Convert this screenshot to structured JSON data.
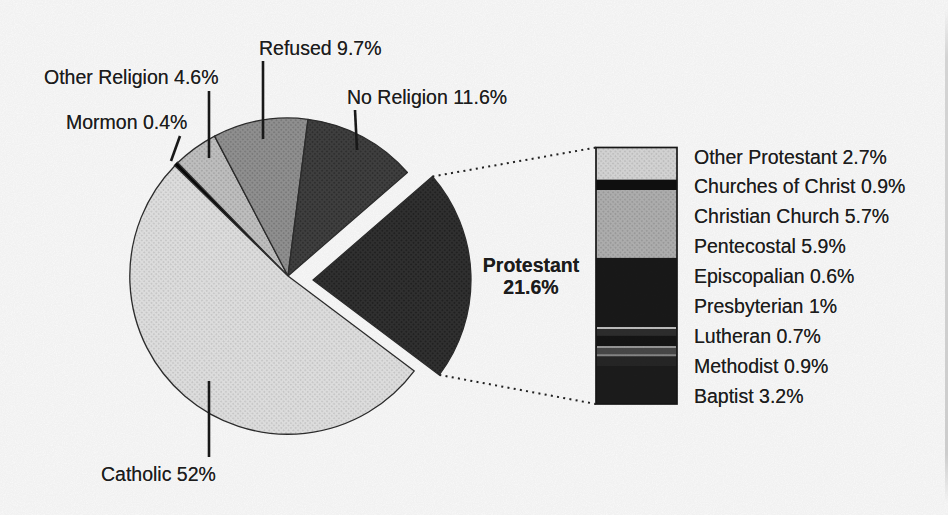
{
  "chart_data": {
    "type": "pie",
    "subtype": "bar-of-pie",
    "title": "",
    "legend_position": "none",
    "background_color": "#ffffff",
    "text_color": "#1c1c1c",
    "pie": {
      "slices": [
        {
          "label": "Mormon",
          "value": 0.4,
          "display": "Mormon 0.4%",
          "color": "#0a0a0a",
          "exploded": false
        },
        {
          "label": "Other Religion",
          "value": 4.6,
          "display": "Other Religion 4.6%",
          "color": "#c7c7c7",
          "dot_color": "#aaaaaa",
          "exploded": false
        },
        {
          "label": "Refused",
          "value": 9.7,
          "display": "Refused 9.7%",
          "color": "#969696",
          "dot_color": "#7b7b7b",
          "exploded": false
        },
        {
          "label": "No Religion",
          "value": 11.6,
          "display": "No Religion 11.6%",
          "color": "#424242",
          "dot_color": "#2d2d2d",
          "exploded": false
        },
        {
          "label": "Protestant",
          "value": 21.6,
          "display": "Protestant 21.6%",
          "display_lines": [
            "Protestant",
            "21.6%"
          ],
          "color": "#323232",
          "dot_color": "#1f1f1f",
          "exploded": true
        },
        {
          "label": "Catholic",
          "value": 52,
          "display": "Catholic 52%",
          "color": "#e7e7e7",
          "dot_color": "#cdcdcd",
          "exploded": false
        }
      ]
    },
    "breakdown": {
      "parent_label": "Protestant",
      "parent_value": 21.6,
      "segments": [
        {
          "label": "Other Protestant",
          "value": 2.7,
          "display": "Other Protestant 2.7%",
          "color": "#dcdcdc",
          "dot_color": "#c3c3c3"
        },
        {
          "label": "Churches of Christ",
          "value": 0.9,
          "display": "Churches of Christ 0.9%",
          "color": "#101010"
        },
        {
          "label": "Christian Church",
          "value": 5.7,
          "display": "Christian Church 5.7%",
          "color": "#b5b5b5",
          "dot_color": "#9d9d9d"
        },
        {
          "label": "Pentecostal",
          "value": 5.9,
          "display": "Pentecostal 5.9%",
          "color": "#1a1a1a"
        },
        {
          "label": "Episcopalian",
          "value": 0.6,
          "display": "Episcopalian 0.6%",
          "color": "#2f2f2f",
          "divider_above": "#c2c2c2"
        },
        {
          "label": "Presbyterian",
          "value": 1,
          "display": "Presbyterian 1%",
          "color": "#161616"
        },
        {
          "label": "Lutheran",
          "value": 0.7,
          "display": "Lutheran 0.7%",
          "color": "#4a4a4a",
          "divider_above": "#9a9a9a"
        },
        {
          "label": "Methodist",
          "value": 0.9,
          "display": "Methodist 0.9%",
          "color": "#272727",
          "divider_above": "#8a8a8a"
        },
        {
          "label": "Baptist",
          "value": 3.2,
          "display": "Baptist 3.2%",
          "color": "#1d1d1d"
        }
      ]
    }
  }
}
